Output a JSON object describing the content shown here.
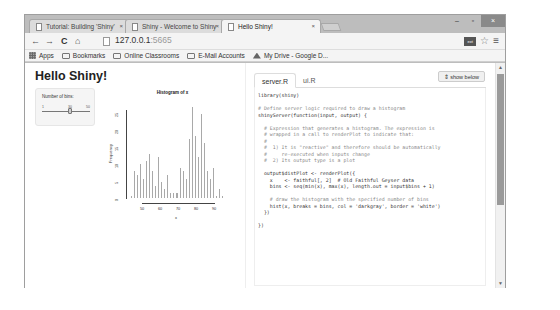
{
  "browser": {
    "tabs": [
      {
        "label": "Tutorial: Building 'Shiny'",
        "active": false
      },
      {
        "label": "Shiny - Welcome to Shiny",
        "active": false
      },
      {
        "label": "Hello Shiny!",
        "active": true
      }
    ],
    "tab_close_glyph": "×",
    "window_controls": {
      "minimize": "–",
      "maximize": "▫",
      "close": "×"
    },
    "nav": {
      "back": "←",
      "forward": "→",
      "reload": "C",
      "home": "⌂"
    },
    "address": {
      "host": "127.0.0.1",
      "port": ":5665"
    },
    "extension_label": "ext",
    "star_glyph": "☆",
    "menu_glyph": "≡",
    "bookmarks": [
      {
        "label": "Apps",
        "icon": "apps-grid-icon"
      },
      {
        "label": "Bookmarks",
        "icon": "folder-icon"
      },
      {
        "label": "Online Classrooms",
        "icon": "folder-icon"
      },
      {
        "label": "E-Mail Accounts",
        "icon": "folder-icon"
      },
      {
        "label": "My Drive - Google D...",
        "icon": "google-drive-icon"
      }
    ]
  },
  "app": {
    "title": "Hello Shiny!",
    "sidebar": {
      "slider_label": "Number of bins:",
      "slider_value": "30",
      "slider_min": "1",
      "slider_max": "50"
    },
    "plot": {
      "title": "Histogram of x",
      "xlabel": "x",
      "ylabel": "Frequency"
    }
  },
  "code_pane": {
    "tabs": [
      {
        "label": "server.R",
        "active": true
      },
      {
        "label": "ui.R",
        "active": false
      }
    ],
    "show_below_label": "⇕ show below",
    "lines": [
      {
        "t": "library(shiny)",
        "c": false
      },
      {
        "t": "",
        "c": false
      },
      {
        "t": "# Define server logic required to draw a histogram",
        "c": true
      },
      {
        "t": "shinyServer(function(input, output) {",
        "c": false
      },
      {
        "t": "",
        "c": false
      },
      {
        "t": "  # Expression that generates a histogram. The expression is",
        "c": true
      },
      {
        "t": "  # wrapped in a call to renderPlot to indicate that:",
        "c": true
      },
      {
        "t": "  #",
        "c": true
      },
      {
        "t": "  #  1) It is \"reactive\" and therefore should be automatically",
        "c": true
      },
      {
        "t": "  #     re-executed when inputs change",
        "c": true
      },
      {
        "t": "  #  2) Its output type is a plot",
        "c": true
      },
      {
        "t": "",
        "c": false
      },
      {
        "t": "  output$distPlot <- renderPlot({",
        "c": false
      },
      {
        "t": "    x    <- faithful[, 2]  # Old Faithful Geyser data",
        "c": false
      },
      {
        "t": "    bins <- seq(min(x), max(x), length.out = input$bins + 1)",
        "c": false
      },
      {
        "t": "",
        "c": false
      },
      {
        "t": "    # draw the histogram with the specified number of bins",
        "c": true
      },
      {
        "t": "    hist(x, breaks = bins, col = 'darkgray', border = 'white')",
        "c": false
      },
      {
        "t": "  })",
        "c": false
      },
      {
        "t": "",
        "c": false
      },
      {
        "t": "})",
        "c": false
      }
    ]
  },
  "chart_data": {
    "type": "bar",
    "title": "Histogram of x",
    "xlabel": "x",
    "ylabel": "Frequency",
    "x_ticks": [
      "50",
      "60",
      "70",
      "80",
      "90"
    ],
    "y_ticks": [
      "0",
      "5",
      "10",
      "15",
      "20",
      "25"
    ],
    "ylim": [
      0,
      25
    ],
    "values": [
      1,
      8,
      7,
      10,
      6,
      11,
      13,
      8,
      4,
      12,
      5,
      3,
      7,
      2,
      2,
      2,
      9,
      8,
      6,
      17,
      26,
      18,
      12,
      24,
      16,
      8,
      6,
      9,
      1,
      3,
      1
    ]
  },
  "colors": {
    "bar_fill": "#a9a9a9",
    "bar_border": "#ffffff",
    "chrome": "#bdbdbd"
  }
}
